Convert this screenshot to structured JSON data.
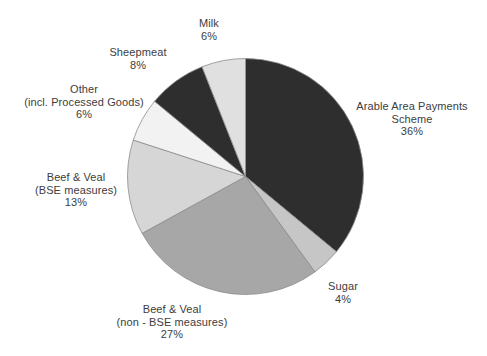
{
  "figure": {
    "width": 487,
    "height": 356,
    "background": "#ffffff",
    "text_color": "#3d3d3d",
    "slice_outline_color": "#8c8c8c"
  },
  "chart_data": {
    "type": "pie",
    "title": "",
    "legend": "none",
    "start_angle": "12 o'clock, clockwise",
    "categories": [
      "Arable Area Payments Scheme",
      "Sugar",
      "Beef & Veal (non - BSE measures)",
      "Beef & Veal (BSE measures)",
      "Other (incl. Processed Goods)",
      "Sheepmeat",
      "Milk"
    ],
    "values": [
      36,
      4,
      27,
      13,
      6,
      8,
      6
    ],
    "center": {
      "x": 245.5,
      "y": 176.5
    },
    "radius": 118,
    "slices": [
      {
        "name": "arable-area-payments-scheme",
        "label_lines": [
          "Arable Area Payments",
          "Scheme",
          "36%"
        ],
        "percent": 36,
        "color": "#2e2e2e",
        "label_pos": {
          "x": 412,
          "y": 119
        }
      },
      {
        "name": "sugar",
        "label_lines": [
          "Sugar",
          "4%"
        ],
        "percent": 4,
        "color": "#c6c6c6",
        "label_pos": {
          "x": 343,
          "y": 293
        }
      },
      {
        "name": "beef-veal-non-bse-measures",
        "label_lines": [
          "Beef & Veal",
          "(non - BSE measures)",
          "27%"
        ],
        "percent": 27,
        "color": "#a7a7a7",
        "label_pos": {
          "x": 172,
          "y": 322
        }
      },
      {
        "name": "beef-veal-bse-measures",
        "label_lines": [
          "Beef & Veal",
          "(BSE measures)",
          "13%"
        ],
        "percent": 13,
        "color": "#d6d6d6",
        "label_pos": {
          "x": 76,
          "y": 190
        }
      },
      {
        "name": "other-incl-processed-goods",
        "label_lines": [
          "Other",
          "(incl. Processed Goods)",
          "6%"
        ],
        "percent": 6,
        "color": "#f2f2f2",
        "label_pos": {
          "x": 84,
          "y": 102
        }
      },
      {
        "name": "sheepmeat",
        "label_lines": [
          "Sheepmeat",
          "8%"
        ],
        "percent": 8,
        "color": "#2e2e2e",
        "label_pos": {
          "x": 138,
          "y": 59
        }
      },
      {
        "name": "milk",
        "label_lines": [
          "Milk",
          "6%"
        ],
        "percent": 6,
        "color": "#e0e0e0",
        "label_pos": {
          "x": 209,
          "y": 30
        }
      }
    ]
  }
}
